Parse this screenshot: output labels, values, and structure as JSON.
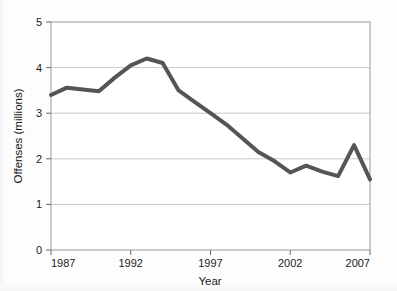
{
  "chart_data": {
    "type": "line",
    "title": "",
    "subtitle": "",
    "xlabel": "Year",
    "ylabel": "Offenses (millions)",
    "xlim": [
      1987,
      2007
    ],
    "ylim": [
      0,
      5
    ],
    "grid": true,
    "legend": false,
    "legend_position": "none",
    "line_color": "#555555",
    "line_width": 4,
    "x_tick_labels": [
      "1987",
      "1992",
      "1997",
      "2002",
      "2007"
    ],
    "x_ticks": [
      1987,
      1992,
      1997,
      2002,
      2007
    ],
    "y_tick_labels": [
      "0",
      "1",
      "2",
      "3",
      "4",
      "5"
    ],
    "y_ticks": [
      0,
      1,
      2,
      3,
      4,
      5
    ],
    "x": [
      1987,
      1988,
      1989,
      1990,
      1991,
      1992,
      1993,
      1994,
      1995,
      1996,
      1997,
      1998,
      1999,
      2000,
      2001,
      2002,
      2003,
      2004,
      2005,
      2006,
      2007
    ],
    "series": [
      {
        "name": "Offenses",
        "values": [
          3.4,
          3.56,
          3.52,
          3.48,
          3.78,
          4.05,
          4.2,
          4.1,
          3.5,
          3.25,
          3.0,
          2.75,
          2.45,
          2.15,
          1.95,
          1.7,
          1.85,
          1.72,
          1.62,
          2.3,
          1.55
        ]
      }
    ],
    "annotations": []
  },
  "axes": {
    "x_axis_title": "Year",
    "y_axis_title": "Offenses (millions)"
  }
}
